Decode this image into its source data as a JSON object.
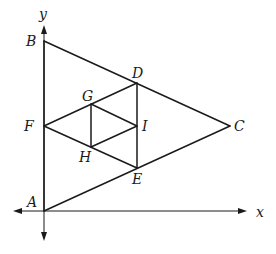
{
  "diagram": {
    "type": "geometric-figure",
    "axes": {
      "x_label": "x",
      "y_label": "y"
    },
    "points": {
      "A": {
        "label": "A",
        "x": 44,
        "y": 211
      },
      "B": {
        "label": "B",
        "x": 44,
        "y": 41
      },
      "C": {
        "label": "C",
        "x": 230,
        "y": 126
      },
      "D": {
        "label": "D",
        "x": 137,
        "y": 83
      },
      "E": {
        "label": "E",
        "x": 137,
        "y": 168
      },
      "F": {
        "label": "F",
        "x": 44,
        "y": 126
      },
      "G": {
        "label": "G",
        "x": 91,
        "y": 104
      },
      "H": {
        "label": "H",
        "x": 91,
        "y": 147
      },
      "I": {
        "label": "I",
        "x": 137,
        "y": 126
      }
    },
    "segments": [
      [
        "A",
        "B"
      ],
      [
        "B",
        "C"
      ],
      [
        "C",
        "A"
      ],
      [
        "D",
        "E"
      ],
      [
        "E",
        "F"
      ],
      [
        "F",
        "D"
      ],
      [
        "G",
        "H"
      ],
      [
        "H",
        "I"
      ],
      [
        "I",
        "G"
      ]
    ],
    "labels": {
      "A": "A",
      "B": "B",
      "C": "C",
      "D": "D",
      "E": "E",
      "F": "F",
      "G": "G",
      "H": "H",
      "I": "I"
    }
  }
}
